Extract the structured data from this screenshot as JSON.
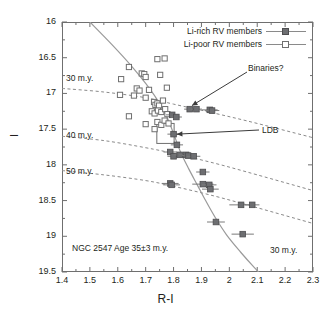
{
  "chart_data": {
    "type": "scatter",
    "title": "",
    "xlabel": "R-I",
    "ylabel": "I",
    "xlim": [
      1.4,
      2.3
    ],
    "ylim": [
      19.5,
      16.0
    ],
    "y_inverted": true,
    "grid": false,
    "xticks": [
      "1.4",
      "1.5",
      "1.6",
      "1.7",
      "1.8",
      "1.9",
      "2",
      "2.1",
      "2.2",
      "2.3"
    ],
    "xtick_values": [
      1.4,
      1.5,
      1.6,
      1.7,
      1.8,
      1.9,
      2.0,
      2.1,
      2.2,
      2.3
    ],
    "yticks": [
      "16",
      "16.5",
      "17",
      "17.5",
      "18",
      "18.5",
      "19",
      "19.5"
    ],
    "ytick_values": [
      16,
      16.5,
      17,
      17.5,
      18,
      18.5,
      19,
      19.5
    ],
    "legend_position": "top-right",
    "series": [
      {
        "name": "Li-rich RV members",
        "marker": "filled-square",
        "color": "#6d6e71",
        "points": [
          {
            "x": 1.795,
            "y": 17.3,
            "xerr": 0.022
          },
          {
            "x": 1.8,
            "y": 17.57,
            "xerr": 0.022
          },
          {
            "x": 1.81,
            "y": 17.33,
            "xerr": 0.02
          },
          {
            "x": 1.858,
            "y": 17.22,
            "xerr": 0.02
          },
          {
            "x": 1.882,
            "y": 17.22,
            "xerr": 0.02
          },
          {
            "x": 1.93,
            "y": 17.23,
            "xerr": 0.028
          },
          {
            "x": 1.938,
            "y": 17.24,
            "xerr": 0.026
          },
          {
            "x": 1.812,
            "y": 17.72,
            "xerr": 0.022
          },
          {
            "x": 1.788,
            "y": 17.82,
            "xerr": 0.024
          },
          {
            "x": 1.8,
            "y": 17.88,
            "xerr": 0.022
          },
          {
            "x": 1.822,
            "y": 17.86,
            "xerr": 0.022
          },
          {
            "x": 1.845,
            "y": 17.86,
            "xerr": 0.026
          },
          {
            "x": 1.852,
            "y": 17.87,
            "xerr": 0.022
          },
          {
            "x": 1.872,
            "y": 17.88,
            "xerr": 0.024
          },
          {
            "x": 1.905,
            "y": 18.1,
            "xerr": 0.024
          },
          {
            "x": 1.788,
            "y": 18.26,
            "xerr": 0.03
          },
          {
            "x": 1.793,
            "y": 18.28,
            "xerr": 0.03
          },
          {
            "x": 1.905,
            "y": 18.27,
            "xerr": 0.038
          },
          {
            "x": 1.928,
            "y": 18.28,
            "xerr": 0.026
          },
          {
            "x": 1.932,
            "y": 18.34,
            "xerr": 0.03
          },
          {
            "x": 2.042,
            "y": 18.56,
            "xerr": 0.042
          },
          {
            "x": 2.082,
            "y": 18.56,
            "xerr": 0.026
          },
          {
            "x": 1.952,
            "y": 18.8,
            "xerr": 0.032
          },
          {
            "x": 2.048,
            "y": 18.97,
            "xerr": 0.04
          }
        ]
      },
      {
        "name": "Li-poor RV members",
        "marker": "open-square",
        "color": "#6f6f6f",
        "points": [
          {
            "x": 1.64,
            "y": 16.63
          },
          {
            "x": 1.612,
            "y": 16.8
          },
          {
            "x": 1.742,
            "y": 16.52
          },
          {
            "x": 1.768,
            "y": 16.51
          },
          {
            "x": 1.686,
            "y": 16.72
          },
          {
            "x": 1.695,
            "y": 16.73
          },
          {
            "x": 1.7,
            "y": 16.77
          },
          {
            "x": 1.752,
            "y": 16.74
          },
          {
            "x": 1.608,
            "y": 17.02
          },
          {
            "x": 1.668,
            "y": 16.93
          },
          {
            "x": 1.678,
            "y": 16.96
          },
          {
            "x": 1.712,
            "y": 16.95
          },
          {
            "x": 1.776,
            "y": 16.92
          },
          {
            "x": 1.658,
            "y": 17.03
          },
          {
            "x": 1.7,
            "y": 17.06
          },
          {
            "x": 1.73,
            "y": 17.12
          },
          {
            "x": 1.735,
            "y": 17.16
          },
          {
            "x": 1.742,
            "y": 17.14
          },
          {
            "x": 1.748,
            "y": 17.17
          },
          {
            "x": 1.762,
            "y": 17.1
          },
          {
            "x": 1.64,
            "y": 17.32
          },
          {
            "x": 1.722,
            "y": 17.25
          },
          {
            "x": 1.732,
            "y": 17.28
          },
          {
            "x": 1.744,
            "y": 17.24
          },
          {
            "x": 1.756,
            "y": 17.26
          },
          {
            "x": 1.77,
            "y": 17.22
          },
          {
            "x": 1.778,
            "y": 17.29
          },
          {
            "x": 1.7,
            "y": 17.43
          },
          {
            "x": 1.742,
            "y": 17.4
          },
          {
            "x": 1.756,
            "y": 17.44
          },
          {
            "x": 1.768,
            "y": 17.38
          },
          {
            "x": 1.782,
            "y": 17.42
          },
          {
            "x": 1.732,
            "y": 17.5
          }
        ]
      }
    ],
    "isochrones": [
      {
        "label": "30 m.y.",
        "style": "dashed",
        "path": [
          [
            1.4,
            16.93
          ],
          [
            1.55,
            16.98
          ],
          [
            1.7,
            17.06
          ],
          [
            1.8,
            17.15
          ],
          [
            1.95,
            17.28
          ],
          [
            2.1,
            17.42
          ],
          [
            2.3,
            17.62
          ]
        ]
      },
      {
        "label": "40 m.y.",
        "style": "dashed",
        "path": [
          [
            1.4,
            17.6
          ],
          [
            1.55,
            17.66
          ],
          [
            1.7,
            17.76
          ],
          [
            1.8,
            17.84
          ],
          [
            1.95,
            17.98
          ],
          [
            2.1,
            18.14
          ],
          [
            2.3,
            18.36
          ]
        ]
      },
      {
        "label": "50 m.y.",
        "style": "dashed",
        "path": [
          [
            1.4,
            18.08
          ],
          [
            1.55,
            18.14
          ],
          [
            1.7,
            18.22
          ],
          [
            1.8,
            18.3
          ],
          [
            1.95,
            18.44
          ],
          [
            2.1,
            18.6
          ],
          [
            2.3,
            18.82
          ]
        ]
      }
    ],
    "model_curve": {
      "label": "30 m.y.",
      "style": "solid",
      "path": [
        [
          1.5,
          16.0
        ],
        [
          1.58,
          16.32
        ],
        [
          1.65,
          16.62
        ],
        [
          1.7,
          16.86
        ],
        [
          1.74,
          17.08
        ],
        [
          1.775,
          17.32
        ],
        [
          1.8,
          17.56
        ],
        [
          1.825,
          17.82
        ],
        [
          1.855,
          18.06
        ],
        [
          1.885,
          18.28
        ],
        [
          1.915,
          18.5
        ],
        [
          1.95,
          18.74
        ],
        [
          1.99,
          18.98
        ],
        [
          2.04,
          19.22
        ],
        [
          2.09,
          19.44
        ],
        [
          2.13,
          19.6
        ]
      ]
    },
    "ldb_box": {
      "label": "LDB",
      "x0": 1.74,
      "x1": 1.802,
      "y0": 17.42,
      "y1": 17.7
    },
    "annotations": [
      {
        "name": "cluster-info",
        "text": "NGC 2547 Age 35±3 m.y.",
        "x": 1.44,
        "y": 19.22
      },
      {
        "name": "binaries",
        "text": "Binaries?",
        "x": 2.08,
        "y": 16.7
      },
      {
        "name": "ldb",
        "text": "LDB",
        "x": 2.14,
        "y": 17.52
      },
      {
        "name": "model-curve-30",
        "text": "30 m.y.",
        "x": 2.16,
        "y": 19.22
      },
      {
        "name": "isochrone-30",
        "text": "30 m.y.",
        "x": 1.455,
        "y": 16.86
      },
      {
        "name": "isochrone-40",
        "text": "40 m.y.",
        "x": 1.455,
        "y": 17.66
      },
      {
        "name": "isochrone-50",
        "text": "50 m.y.",
        "x": 1.455,
        "y": 18.16
      }
    ]
  },
  "legend": {
    "items": [
      {
        "label": "Li-rich RV members",
        "marker": "filled-square"
      },
      {
        "label": "Li-poor RV members",
        "marker": "open-square"
      }
    ]
  },
  "axes": {
    "x_title": "R-I",
    "y_title": "I"
  },
  "colors": {
    "filled_marker": "#6d6e71",
    "open_marker": "#6f6f6f",
    "axis": "#6f6f6f",
    "curve": "#8a8a8a",
    "text": "#231f20"
  }
}
